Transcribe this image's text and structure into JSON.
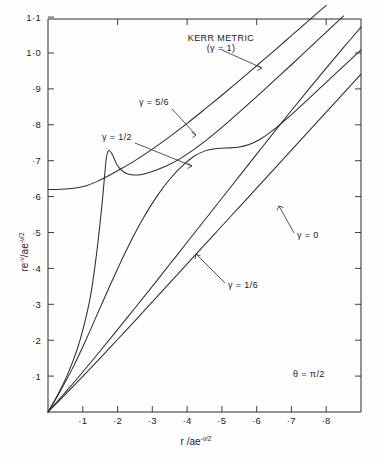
{
  "chart_data": {
    "type": "line",
    "title": "",
    "xlabel": "r/ae^(-ν/2)",
    "ylabel": "re^(-ν)/ae^(-ν/2)",
    "xlim": [
      0,
      0.9
    ],
    "ylim": [
      0,
      1.16
    ],
    "grid": false,
    "legend_position": "inline-annotations",
    "xticks": [
      0.1,
      0.2,
      0.3,
      0.4,
      0.5,
      0.6,
      0.7,
      0.8
    ],
    "xtick_labels": [
      "·1",
      "·2",
      "·3",
      "·4",
      "·5",
      "·6",
      "·7",
      "·8"
    ],
    "yticks": [
      0.1,
      0.2,
      0.3,
      0.4,
      0.5,
      0.6,
      0.7,
      0.8,
      0.9,
      1.0,
      1.1
    ],
    "ytick_labels": [
      "·1",
      "·2",
      "·3",
      "·4",
      "·5",
      "·6",
      "·7",
      "·8",
      "·9",
      "1·0",
      "1·1"
    ],
    "condition": "θ = π/2",
    "series": [
      {
        "name": "KERR METRIC (γ = 1)",
        "gamma": 1,
        "points": [
          [
            0.0,
            0.657
          ],
          [
            0.02,
            0.657
          ],
          [
            0.05,
            0.658
          ],
          [
            0.08,
            0.661
          ],
          [
            0.11,
            0.668
          ],
          [
            0.14,
            0.68
          ],
          [
            0.17,
            0.695
          ],
          [
            0.2,
            0.712
          ],
          [
            0.25,
            0.742
          ],
          [
            0.3,
            0.776
          ],
          [
            0.35,
            0.813
          ],
          [
            0.4,
            0.852
          ],
          [
            0.45,
            0.893
          ],
          [
            0.5,
            0.935
          ],
          [
            0.55,
            0.978
          ],
          [
            0.6,
            1.022
          ],
          [
            0.65,
            1.066
          ],
          [
            0.7,
            1.111
          ],
          [
            0.75,
            1.156
          ],
          [
            0.8,
            1.2
          ],
          [
            0.85,
            1.245
          ],
          [
            0.9,
            1.29
          ]
        ]
      },
      {
        "name": "γ = 5/6",
        "gamma": 0.8333,
        "points": [
          [
            0.0,
            0.0
          ],
          [
            0.03,
            0.055
          ],
          [
            0.06,
            0.12
          ],
          [
            0.09,
            0.205
          ],
          [
            0.12,
            0.33
          ],
          [
            0.14,
            0.47
          ],
          [
            0.155,
            0.61
          ],
          [
            0.163,
            0.7
          ],
          [
            0.168,
            0.752
          ],
          [
            0.175,
            0.772
          ],
          [
            0.185,
            0.76
          ],
          [
            0.2,
            0.727
          ],
          [
            0.22,
            0.707
          ],
          [
            0.24,
            0.7
          ],
          [
            0.27,
            0.701
          ],
          [
            0.3,
            0.71
          ],
          [
            0.34,
            0.726
          ],
          [
            0.38,
            0.748
          ],
          [
            0.42,
            0.775
          ],
          [
            0.46,
            0.806
          ],
          [
            0.5,
            0.84
          ],
          [
            0.55,
            0.885
          ],
          [
            0.6,
            0.931
          ],
          [
            0.65,
            0.978
          ],
          [
            0.7,
            1.025
          ],
          [
            0.75,
            1.073
          ],
          [
            0.8,
            1.121
          ],
          [
            0.85,
            1.169
          ],
          [
            0.9,
            1.217
          ]
        ]
      },
      {
        "name": "γ = 1/2",
        "gamma": 0.5,
        "points": [
          [
            0.0,
            0.0
          ],
          [
            0.03,
            0.052
          ],
          [
            0.07,
            0.128
          ],
          [
            0.11,
            0.215
          ],
          [
            0.15,
            0.308
          ],
          [
            0.19,
            0.4
          ],
          [
            0.23,
            0.487
          ],
          [
            0.27,
            0.565
          ],
          [
            0.31,
            0.632
          ],
          [
            0.35,
            0.687
          ],
          [
            0.39,
            0.73
          ],
          [
            0.42,
            0.755
          ],
          [
            0.45,
            0.77
          ],
          [
            0.48,
            0.777
          ],
          [
            0.51,
            0.779
          ],
          [
            0.55,
            0.782
          ],
          [
            0.58,
            0.79
          ],
          [
            0.61,
            0.805
          ],
          [
            0.64,
            0.826
          ],
          [
            0.67,
            0.851
          ],
          [
            0.7,
            0.878
          ],
          [
            0.75,
            0.925
          ],
          [
            0.8,
            0.973
          ],
          [
            0.85,
            1.021
          ],
          [
            0.9,
            1.069
          ]
        ]
      },
      {
        "name": "γ = 1/6",
        "gamma": 0.1667,
        "points": [
          [
            0.0,
            0.0
          ],
          [
            0.05,
            0.058
          ],
          [
            0.1,
            0.118
          ],
          [
            0.15,
            0.18
          ],
          [
            0.2,
            0.243
          ],
          [
            0.25,
            0.307
          ],
          [
            0.3,
            0.371
          ],
          [
            0.35,
            0.436
          ],
          [
            0.4,
            0.501
          ],
          [
            0.45,
            0.566
          ],
          [
            0.5,
            0.631
          ],
          [
            0.55,
            0.696
          ],
          [
            0.6,
            0.761
          ],
          [
            0.65,
            0.826
          ],
          [
            0.7,
            0.89
          ],
          [
            0.75,
            0.953
          ],
          [
            0.8,
            1.015
          ],
          [
            0.85,
            1.076
          ],
          [
            0.9,
            1.136
          ]
        ]
      },
      {
        "name": "γ = 0",
        "gamma": 0,
        "points": [
          [
            0.0,
            0.0
          ],
          [
            0.05,
            0.052
          ],
          [
            0.1,
            0.105
          ],
          [
            0.15,
            0.159
          ],
          [
            0.2,
            0.214
          ],
          [
            0.25,
            0.269
          ],
          [
            0.3,
            0.325
          ],
          [
            0.35,
            0.381
          ],
          [
            0.4,
            0.437
          ],
          [
            0.45,
            0.493
          ],
          [
            0.5,
            0.549
          ],
          [
            0.55,
            0.605
          ],
          [
            0.6,
            0.661
          ],
          [
            0.65,
            0.717
          ],
          [
            0.7,
            0.773
          ],
          [
            0.75,
            0.829
          ],
          [
            0.8,
            0.885
          ],
          [
            0.85,
            0.941
          ],
          [
            0.9,
            0.997
          ]
        ]
      }
    ],
    "annotations": [
      {
        "id": "kerr",
        "line1": "KERR METRIC",
        "line2": "(γ = 1)"
      },
      {
        "id": "g56",
        "text": "γ = 5/6"
      },
      {
        "id": "g12",
        "text": "γ = 1/2"
      },
      {
        "id": "g0",
        "text": "γ = 0"
      },
      {
        "id": "g16",
        "text": "γ = 1/6"
      },
      {
        "id": "theta",
        "text": "θ = π/2"
      }
    ]
  },
  "axes": {
    "y_title_main": "re",
    "y_title_sup1": "-ν",
    "y_title_mid": "/ae",
    "y_title_sup2": "-ν/2",
    "x_title_main": "r /ae",
    "x_title_sup": "-ν/2"
  }
}
